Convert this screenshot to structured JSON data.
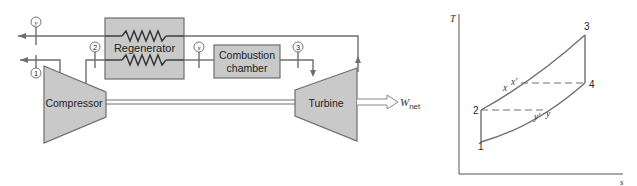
{
  "schematic": {
    "components": {
      "regenerator": "Regenerator",
      "combustion_line1": "Combustion",
      "combustion_line2": "chamber",
      "compressor": "Compressor",
      "turbine": "Turbine"
    },
    "state_markers": {
      "y": "y",
      "s1": "1",
      "s2": "2",
      "x": "x",
      "s3": "3"
    },
    "work_output": {
      "symbol": "W",
      "subscript": "net"
    }
  },
  "ts_diagram": {
    "y_axis_label": "T",
    "x_axis_label": "s",
    "points": {
      "p1": "1",
      "p2": "2",
      "p3": "3",
      "p4": "4",
      "x": "x",
      "x_prime": "x′",
      "y": "y",
      "y_prime": "y′"
    }
  },
  "colors": {
    "component_fill": "#c9c9c9",
    "line": "#6e6e6e",
    "text": "#222222"
  }
}
